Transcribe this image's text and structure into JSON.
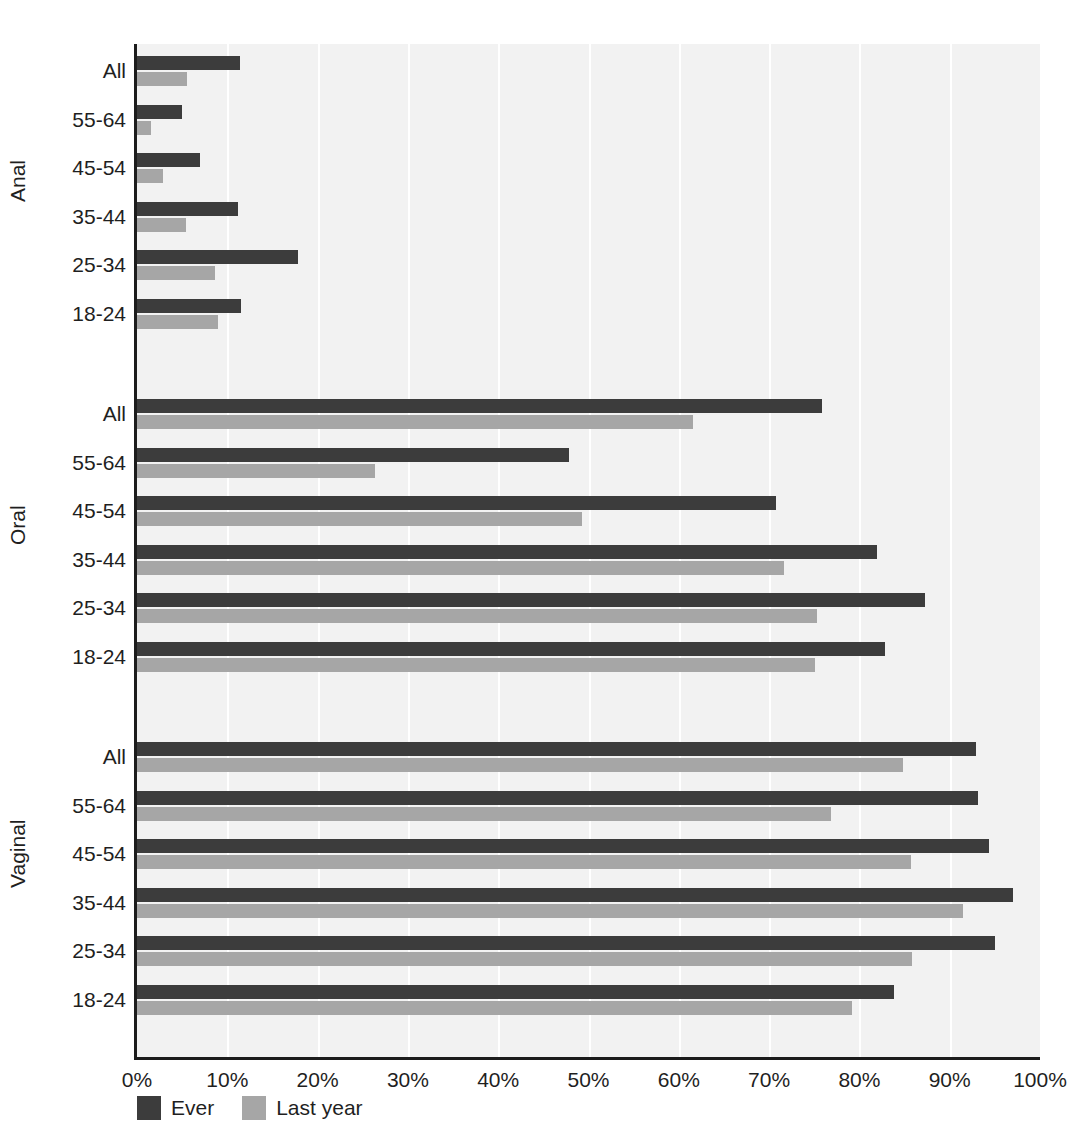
{
  "chart_data": {
    "type": "bar",
    "orientation": "horizontal",
    "title": "",
    "subtitle": "",
    "xlabel": "",
    "ylabel": "",
    "xlim": [
      0,
      100
    ],
    "xticks": [
      "0%",
      "10%",
      "20%",
      "30%",
      "40%",
      "50%",
      "60%",
      "70%",
      "80%",
      "90%",
      "100%"
    ],
    "xtick_values": [
      0,
      10,
      20,
      30,
      40,
      50,
      60,
      70,
      80,
      90,
      100
    ],
    "grid": "vertical",
    "units": "percent",
    "legend_position": "bottom-left",
    "legend": [
      {
        "name": "Ever",
        "color": "#3c3c3c"
      },
      {
        "name": "Last year",
        "color": "#a6a6a6"
      }
    ],
    "series": [
      {
        "name": "Ever",
        "key": "ever",
        "color": "#3c3c3c"
      },
      {
        "name": "Last year",
        "key": "last",
        "color": "#a6a6a6"
      }
    ],
    "groups": [
      {
        "name": "Anal",
        "categories": [
          {
            "label": "All",
            "ever": 11.4,
            "last": 5.5
          },
          {
            "label": "55-64",
            "ever": 5.0,
            "last": 1.5
          },
          {
            "label": "45-54",
            "ever": 7.0,
            "last": 2.9
          },
          {
            "label": "35-44",
            "ever": 11.2,
            "last": 5.4
          },
          {
            "label": "25-34",
            "ever": 17.8,
            "last": 8.6
          },
          {
            "label": "18-24",
            "ever": 11.5,
            "last": 9.0
          }
        ]
      },
      {
        "name": "Oral",
        "categories": [
          {
            "label": "All",
            "ever": 75.9,
            "last": 61.6
          },
          {
            "label": "55-64",
            "ever": 47.8,
            "last": 26.4
          },
          {
            "label": "45-54",
            "ever": 70.8,
            "last": 49.3
          },
          {
            "label": "35-44",
            "ever": 82.0,
            "last": 71.6
          },
          {
            "label": "25-34",
            "ever": 87.3,
            "last": 75.3
          },
          {
            "label": "18-24",
            "ever": 82.8,
            "last": 75.1
          }
        ]
      },
      {
        "name": "Vaginal",
        "categories": [
          {
            "label": "All",
            "ever": 92.9,
            "last": 84.8
          },
          {
            "label": "55-64",
            "ever": 93.1,
            "last": 76.9
          },
          {
            "label": "45-54",
            "ever": 94.4,
            "last": 85.7
          },
          {
            "label": "35-44",
            "ever": 97.0,
            "last": 91.5
          },
          {
            "label": "25-34",
            "ever": 95.0,
            "last": 85.8
          },
          {
            "label": "18-24",
            "ever": 83.8,
            "last": 79.2
          }
        ]
      }
    ]
  },
  "colors": {
    "ever": "#3c3c3c",
    "last_year": "#a6a6a6",
    "plot_background": "#f2f2f2",
    "gridline": "#ffffff",
    "axis": "#1c1c1c",
    "text": "#1f1f1f",
    "page_background": "#ffffff"
  }
}
